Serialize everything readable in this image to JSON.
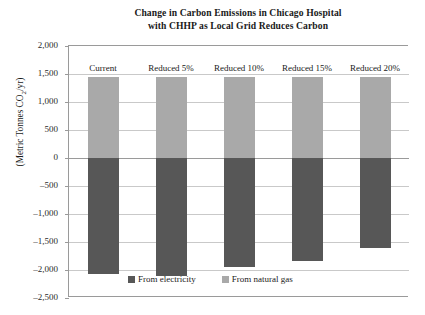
{
  "chart_data": {
    "type": "bar",
    "subtype": "stacked-diverging",
    "title": "Change in Carbon Emissions in Chicago Hospital with CHHP as Local Grid Reduces Carbon",
    "title_lines": [
      "Change in Carbon Emissions in Chicago Hospital",
      "with CHHP as Local Grid Reduces Carbon"
    ],
    "xlabel": "",
    "ylabel": "(Metric Tonnes CO2/yr)",
    "ylabel_prefix": "(Metric Tonnes CO",
    "ylabel_sub": "2",
    "ylabel_suffix": "/yr)",
    "categories": [
      "Current",
      "Reduced 5%",
      "Reduced 10%",
      "Reduced 15%",
      "Reduced 20%"
    ],
    "series": [
      {
        "name": "From electricity",
        "color": "#575757",
        "values": [
          -2080,
          -2100,
          -1940,
          -1840,
          -1600
        ]
      },
      {
        "name": "From natural gas",
        "color": "#a9a9a9",
        "values": [
          1450,
          1450,
          1450,
          1450,
          1450
        ]
      }
    ],
    "ylim": [
      -2500,
      2000
    ],
    "yticks": [
      2000,
      1500,
      1000,
      500,
      0,
      -500,
      -1000,
      -1500,
      -2000,
      -2500
    ],
    "ytick_labels": [
      "2,000",
      "1,500",
      "1,000",
      "500",
      "0",
      "-500",
      "-1,000",
      "-1,500",
      "-2,000",
      "-2,500"
    ],
    "grid": true,
    "legend_position": "inside-bottom-center",
    "legend": [
      "From electricity",
      "From natural gas"
    ]
  },
  "legend": {
    "electricity_label": "From electricity",
    "natural_gas_label": "From natural gas"
  }
}
